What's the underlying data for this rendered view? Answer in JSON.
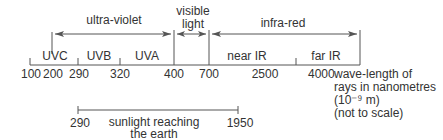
{
  "diagram": {
    "regions": [
      {
        "label": "ultra-violet",
        "from": 200,
        "to": 400
      },
      {
        "label_line1": "visible",
        "label_line2": "light",
        "from": 400,
        "to": 700
      },
      {
        "label": "infra-red",
        "from": 700,
        "to": 4000
      }
    ],
    "bands": [
      {
        "label": "UVC",
        "from": 100,
        "to": 290
      },
      {
        "label": "UVB",
        "from": 290,
        "to": 320
      },
      {
        "label": "UVA",
        "from": 320,
        "to": 400
      },
      {
        "label": "near IR",
        "from": 700,
        "to": 2500
      },
      {
        "label": "far IR",
        "from": 2500,
        "to": 4000
      }
    ],
    "ticks": [
      "100",
      "200",
      "290",
      "320",
      "400",
      "700",
      "2500",
      "4000"
    ],
    "axis_label": {
      "line1": "wave-length of",
      "line2": "rays in nanometres",
      "line3": "(10⁻⁹ m)",
      "line4": "(not to scale)"
    },
    "sunlight": {
      "start": "290",
      "end": "1950",
      "label_line1": "sunlight reaching",
      "label_line2": "the earth"
    }
  }
}
